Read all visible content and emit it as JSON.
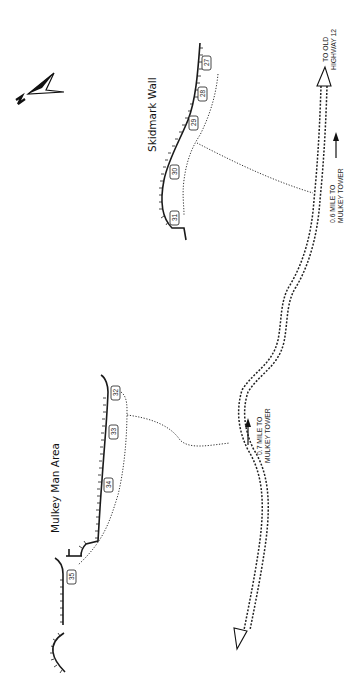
{
  "map": {
    "orientation": "rotated 90deg (text reads bottom-to-top)",
    "north_arrow": {
      "label": "N",
      "icon": "north-arrow-icon"
    },
    "areas": [
      {
        "name": "Skidmark Wall",
        "routes": [
          "27",
          "28",
          "29",
          "30",
          "31"
        ]
      },
      {
        "name": "Mulkey Man Area",
        "routes": [
          "32",
          "33",
          "34",
          "35"
        ]
      }
    ],
    "annotations": {
      "to_highway_line1": "TO OLD",
      "to_highway_line2": "HIGHWAY 12",
      "tower_06_line1": "0.6 MILE TO",
      "tower_06_line2": "MULKEY TOWER",
      "tower_07_line1": "0.7 MILE TO",
      "tower_07_line2": "MULKEY TOWER"
    },
    "route_labels": {
      "r27": "27",
      "r28": "28",
      "r29": "29",
      "r30": "30",
      "r31": "31",
      "r32": "32",
      "r33": "33",
      "r34": "34",
      "r35": "35"
    },
    "colors": {
      "ink": "#1a1a1a",
      "background": "#ffffff"
    }
  }
}
